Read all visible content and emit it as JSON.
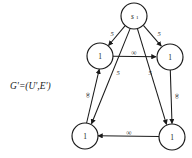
{
  "figure": {
    "caption": "G'=(U',E')",
    "nodes": [
      {
        "id": "s1",
        "label": "s",
        "sublabel": "1",
        "cx": 134,
        "cy": 16,
        "r": 13
      },
      {
        "id": "u-left",
        "label": "1",
        "sublabel": "",
        "cx": 100,
        "cy": 56,
        "r": 13
      },
      {
        "id": "u-right",
        "label": "1",
        "sublabel": "",
        "cx": 170,
        "cy": 57,
        "r": 13
      },
      {
        "id": "v-left",
        "label": "1",
        "sublabel": "",
        "cx": 85,
        "cy": 136,
        "r": 13
      },
      {
        "id": "v-right",
        "label": "1",
        "sublabel": "",
        "cx": 172,
        "cy": 137,
        "r": 13
      }
    ],
    "edges": [
      {
        "id": "s1-to-u-left",
        "from": "s1",
        "to": "u-left",
        "weight": "5"
      },
      {
        "id": "s1-to-u-right",
        "from": "s1",
        "to": "u-right",
        "weight": "5"
      },
      {
        "id": "s1-to-v-left",
        "from": "s1",
        "to": "v-left",
        "weight": "5"
      },
      {
        "id": "s1-to-v-right",
        "from": "s1",
        "to": "v-right",
        "weight": "5"
      },
      {
        "id": "u-left-to-u-right",
        "from": "u-left",
        "to": "u-right",
        "weight": "∞"
      },
      {
        "id": "v-left-to-u-left",
        "from": "v-left",
        "to": "u-left",
        "weight": "∞"
      },
      {
        "id": "u-right-to-v-right",
        "from": "u-right",
        "to": "v-right",
        "weight": "∞"
      },
      {
        "id": "v-right-to-v-left",
        "from": "v-right",
        "to": "v-left",
        "weight": "∞"
      }
    ],
    "weights": {
      "s1_u_left": "5",
      "s1_u_right": "5",
      "s1_v_left": "5",
      "s1_v_right": "5",
      "u_left_u_right": "∞",
      "v_left_u_left": "∞",
      "u_right_v_right": "∞",
      "v_right_v_left": "∞"
    },
    "colors": {
      "stroke": "#1a1a1a",
      "fill": "#ffffff",
      "background": "#ffffff"
    }
  }
}
